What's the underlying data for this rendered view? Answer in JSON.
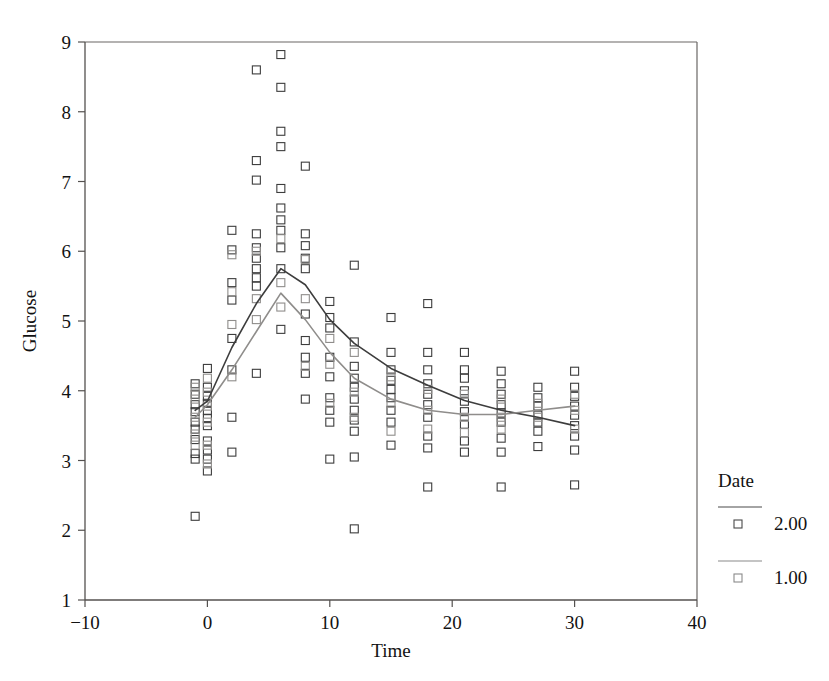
{
  "chart_data": {
    "type": "scatter",
    "title": "",
    "xlabel": "Time",
    "ylabel": "Glucose",
    "xlim": [
      -10,
      40
    ],
    "ylim": [
      1,
      9
    ],
    "xticks": [
      -10,
      0,
      10,
      20,
      30,
      40
    ],
    "xticklabels": [
      "−10",
      "0",
      "10",
      "20",
      "30",
      "40"
    ],
    "yticks": [
      1,
      2,
      3,
      4,
      5,
      6,
      7,
      8,
      9
    ],
    "yticklabels": [
      "1",
      "2",
      "3",
      "4",
      "5",
      "6",
      "7",
      "8",
      "9"
    ],
    "grid": false,
    "marker": "open-square",
    "legend": {
      "title": "Date",
      "position": "right",
      "entries": [
        {
          "label": "2.00",
          "marker": "open-square",
          "color": "#4a4a4a"
        },
        {
          "label": "1.00",
          "marker": "open-square",
          "color": "#8a8a8a"
        }
      ]
    },
    "series": [
      {
        "name": "2.00",
        "color": "#3d3d3d",
        "line_color": "#3d3d3d",
        "fit_line": {
          "x": [
            -1,
            0,
            2,
            4,
            6,
            8,
            10,
            12,
            15,
            18,
            21,
            24,
            27,
            30
          ],
          "y": [
            3.72,
            3.85,
            4.62,
            5.25,
            5.75,
            5.52,
            5.02,
            4.68,
            4.32,
            4.08,
            3.86,
            3.72,
            3.62,
            3.5
          ]
        },
        "points": [
          {
            "x": -1,
            "y": 4.1
          },
          {
            "x": -1,
            "y": 3.95
          },
          {
            "x": -1,
            "y": 3.8
          },
          {
            "x": -1,
            "y": 3.7
          },
          {
            "x": -1,
            "y": 3.55
          },
          {
            "x": -1,
            "y": 3.45
          },
          {
            "x": -1,
            "y": 3.3
          },
          {
            "x": -1,
            "y": 3.1
          },
          {
            "x": -1,
            "y": 3.02
          },
          {
            "x": -1,
            "y": 2.2
          },
          {
            "x": 0,
            "y": 4.32
          },
          {
            "x": 0,
            "y": 4.05
          },
          {
            "x": 0,
            "y": 3.92
          },
          {
            "x": 0,
            "y": 3.82
          },
          {
            "x": 0,
            "y": 3.72
          },
          {
            "x": 0,
            "y": 3.6
          },
          {
            "x": 0,
            "y": 3.5
          },
          {
            "x": 0,
            "y": 3.28
          },
          {
            "x": 0,
            "y": 3.15
          },
          {
            "x": 0,
            "y": 3.02
          },
          {
            "x": 0,
            "y": 2.85
          },
          {
            "x": 2,
            "y": 6.3
          },
          {
            "x": 2,
            "y": 6.02
          },
          {
            "x": 2,
            "y": 5.55
          },
          {
            "x": 2,
            "y": 5.3
          },
          {
            "x": 2,
            "y": 4.75
          },
          {
            "x": 2,
            "y": 4.3
          },
          {
            "x": 2,
            "y": 3.62
          },
          {
            "x": 2,
            "y": 3.12
          },
          {
            "x": 4,
            "y": 8.6
          },
          {
            "x": 4,
            "y": 7.3
          },
          {
            "x": 4,
            "y": 7.02
          },
          {
            "x": 4,
            "y": 6.25
          },
          {
            "x": 4,
            "y": 6.05
          },
          {
            "x": 4,
            "y": 5.9
          },
          {
            "x": 4,
            "y": 5.75
          },
          {
            "x": 4,
            "y": 5.62
          },
          {
            "x": 4,
            "y": 5.5
          },
          {
            "x": 4,
            "y": 4.25
          },
          {
            "x": 6,
            "y": 8.82
          },
          {
            "x": 6,
            "y": 8.35
          },
          {
            "x": 6,
            "y": 7.72
          },
          {
            "x": 6,
            "y": 7.5
          },
          {
            "x": 6,
            "y": 6.9
          },
          {
            "x": 6,
            "y": 6.62
          },
          {
            "x": 6,
            "y": 6.45
          },
          {
            "x": 6,
            "y": 6.3
          },
          {
            "x": 6,
            "y": 6.05
          },
          {
            "x": 6,
            "y": 5.75
          },
          {
            "x": 6,
            "y": 4.88
          },
          {
            "x": 8,
            "y": 7.22
          },
          {
            "x": 8,
            "y": 6.25
          },
          {
            "x": 8,
            "y": 6.08
          },
          {
            "x": 8,
            "y": 5.9
          },
          {
            "x": 8,
            "y": 5.75
          },
          {
            "x": 8,
            "y": 5.1
          },
          {
            "x": 8,
            "y": 4.72
          },
          {
            "x": 8,
            "y": 4.48
          },
          {
            "x": 8,
            "y": 4.25
          },
          {
            "x": 8,
            "y": 3.88
          },
          {
            "x": 10,
            "y": 5.28
          },
          {
            "x": 10,
            "y": 5.05
          },
          {
            "x": 10,
            "y": 4.9
          },
          {
            "x": 10,
            "y": 4.48
          },
          {
            "x": 10,
            "y": 4.2
          },
          {
            "x": 10,
            "y": 3.9
          },
          {
            "x": 10,
            "y": 3.72
          },
          {
            "x": 10,
            "y": 3.55
          },
          {
            "x": 10,
            "y": 3.02
          },
          {
            "x": 12,
            "y": 5.8
          },
          {
            "x": 12,
            "y": 4.7
          },
          {
            "x": 12,
            "y": 4.35
          },
          {
            "x": 12,
            "y": 4.18
          },
          {
            "x": 12,
            "y": 4.05
          },
          {
            "x": 12,
            "y": 3.88
          },
          {
            "x": 12,
            "y": 3.72
          },
          {
            "x": 12,
            "y": 3.58
          },
          {
            "x": 12,
            "y": 3.42
          },
          {
            "x": 12,
            "y": 3.05
          },
          {
            "x": 12,
            "y": 2.02
          },
          {
            "x": 15,
            "y": 5.05
          },
          {
            "x": 15,
            "y": 4.55
          },
          {
            "x": 15,
            "y": 4.3
          },
          {
            "x": 15,
            "y": 4.15
          },
          {
            "x": 15,
            "y": 4.02
          },
          {
            "x": 15,
            "y": 3.9
          },
          {
            "x": 15,
            "y": 3.72
          },
          {
            "x": 15,
            "y": 3.55
          },
          {
            "x": 15,
            "y": 3.22
          },
          {
            "x": 18,
            "y": 5.25
          },
          {
            "x": 18,
            "y": 4.55
          },
          {
            "x": 18,
            "y": 4.3
          },
          {
            "x": 18,
            "y": 4.1
          },
          {
            "x": 18,
            "y": 3.95
          },
          {
            "x": 18,
            "y": 3.8
          },
          {
            "x": 18,
            "y": 3.62
          },
          {
            "x": 18,
            "y": 3.35
          },
          {
            "x": 18,
            "y": 3.18
          },
          {
            "x": 18,
            "y": 2.62
          },
          {
            "x": 21,
            "y": 4.55
          },
          {
            "x": 21,
            "y": 4.3
          },
          {
            "x": 21,
            "y": 4.18
          },
          {
            "x": 21,
            "y": 4.0
          },
          {
            "x": 21,
            "y": 3.85
          },
          {
            "x": 21,
            "y": 3.7
          },
          {
            "x": 21,
            "y": 3.52
          },
          {
            "x": 21,
            "y": 3.28
          },
          {
            "x": 21,
            "y": 3.12
          },
          {
            "x": 24,
            "y": 4.28
          },
          {
            "x": 24,
            "y": 4.1
          },
          {
            "x": 24,
            "y": 3.95
          },
          {
            "x": 24,
            "y": 3.8
          },
          {
            "x": 24,
            "y": 3.68
          },
          {
            "x": 24,
            "y": 3.55
          },
          {
            "x": 24,
            "y": 3.32
          },
          {
            "x": 24,
            "y": 3.12
          },
          {
            "x": 24,
            "y": 2.62
          },
          {
            "x": 27,
            "y": 4.05
          },
          {
            "x": 27,
            "y": 3.9
          },
          {
            "x": 27,
            "y": 3.78
          },
          {
            "x": 27,
            "y": 3.65
          },
          {
            "x": 27,
            "y": 3.55
          },
          {
            "x": 27,
            "y": 3.42
          },
          {
            "x": 27,
            "y": 3.2
          },
          {
            "x": 30,
            "y": 4.28
          },
          {
            "x": 30,
            "y": 4.05
          },
          {
            "x": 30,
            "y": 3.92
          },
          {
            "x": 30,
            "y": 3.78
          },
          {
            "x": 30,
            "y": 3.65
          },
          {
            "x": 30,
            "y": 3.5
          },
          {
            "x": 30,
            "y": 3.35
          },
          {
            "x": 30,
            "y": 3.15
          },
          {
            "x": 30,
            "y": 2.65
          }
        ]
      },
      {
        "name": "1.00",
        "color": "#8f8d8b",
        "line_color": "#8f8d8b",
        "fit_line": {
          "x": [
            -1,
            0,
            2,
            4,
            6,
            8,
            10,
            12,
            15,
            18,
            21,
            24,
            27,
            30
          ],
          "y": [
            3.62,
            3.8,
            4.3,
            4.85,
            5.4,
            5.02,
            4.55,
            4.18,
            3.88,
            3.72,
            3.66,
            3.66,
            3.72,
            3.78
          ]
        },
        "points": [
          {
            "x": -1,
            "y": 4.05
          },
          {
            "x": -1,
            "y": 3.88
          },
          {
            "x": -1,
            "y": 3.62
          },
          {
            "x": -1,
            "y": 3.38
          },
          {
            "x": -1,
            "y": 3.22
          },
          {
            "x": 0,
            "y": 4.18
          },
          {
            "x": 0,
            "y": 3.98
          },
          {
            "x": 0,
            "y": 3.78
          },
          {
            "x": 0,
            "y": 3.55
          },
          {
            "x": 0,
            "y": 3.22
          },
          {
            "x": 0,
            "y": 2.95
          },
          {
            "x": 2,
            "y": 5.95
          },
          {
            "x": 2,
            "y": 5.42
          },
          {
            "x": 2,
            "y": 4.95
          },
          {
            "x": 2,
            "y": 4.2
          },
          {
            "x": 4,
            "y": 6.0
          },
          {
            "x": 4,
            "y": 5.32
          },
          {
            "x": 4,
            "y": 5.02
          },
          {
            "x": 6,
            "y": 6.18
          },
          {
            "x": 6,
            "y": 5.55
          },
          {
            "x": 6,
            "y": 5.2
          },
          {
            "x": 8,
            "y": 5.88
          },
          {
            "x": 8,
            "y": 5.32
          },
          {
            "x": 8,
            "y": 4.35
          },
          {
            "x": 10,
            "y": 4.75
          },
          {
            "x": 10,
            "y": 4.38
          },
          {
            "x": 10,
            "y": 3.82
          },
          {
            "x": 12,
            "y": 4.55
          },
          {
            "x": 12,
            "y": 3.98
          },
          {
            "x": 12,
            "y": 3.62
          },
          {
            "x": 15,
            "y": 4.2
          },
          {
            "x": 15,
            "y": 3.82
          },
          {
            "x": 15,
            "y": 3.42
          },
          {
            "x": 18,
            "y": 4.02
          },
          {
            "x": 18,
            "y": 3.72
          },
          {
            "x": 18,
            "y": 3.45
          },
          {
            "x": 21,
            "y": 3.95
          },
          {
            "x": 21,
            "y": 3.62
          },
          {
            "x": 21,
            "y": 3.4
          },
          {
            "x": 24,
            "y": 3.88
          },
          {
            "x": 24,
            "y": 3.62
          },
          {
            "x": 24,
            "y": 3.45
          },
          {
            "x": 27,
            "y": 3.82
          },
          {
            "x": 27,
            "y": 3.62
          },
          {
            "x": 30,
            "y": 3.95
          },
          {
            "x": 30,
            "y": 3.72
          },
          {
            "x": 30,
            "y": 3.45
          }
        ]
      }
    ]
  }
}
